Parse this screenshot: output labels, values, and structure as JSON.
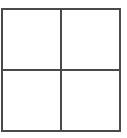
{
  "diagram": {
    "type": "grid",
    "rows": 2,
    "columns": 2,
    "line_color": "#4a4a4a",
    "background_color": "#ffffff",
    "cells": [
      {
        "row": 0,
        "col": 0,
        "label": ""
      },
      {
        "row": 0,
        "col": 1,
        "label": ""
      },
      {
        "row": 1,
        "col": 0,
        "label": ""
      },
      {
        "row": 1,
        "col": 1,
        "label": ""
      }
    ]
  }
}
